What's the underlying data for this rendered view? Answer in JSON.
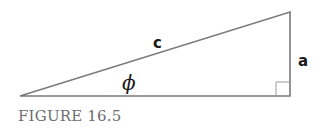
{
  "diagram": {
    "type": "right-triangle",
    "vertices": {
      "left": [
        20,
        96
      ],
      "top_right": [
        290,
        12
      ],
      "bottom_right": [
        290,
        96
      ]
    },
    "labels": {
      "hypotenuse": "c",
      "opposite": "a",
      "angle": "ϕ"
    },
    "right_angle_marker": true,
    "line_color": "#7a7a7a"
  },
  "caption": "FIGURE 16.5"
}
